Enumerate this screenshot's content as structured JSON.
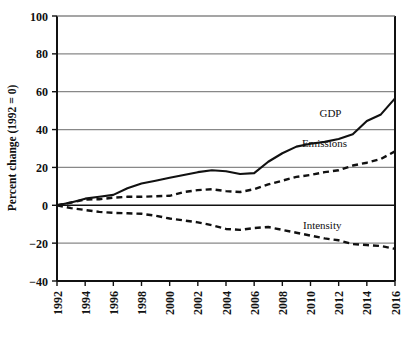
{
  "chart_data": {
    "type": "line",
    "title": "",
    "subtitle": "",
    "xlabel": "",
    "ylabel": "Percent change (1992 = 0)",
    "xlim": [
      1992,
      2016
    ],
    "ylim": [
      -40,
      100
    ],
    "yticks": [
      100,
      80,
      60,
      40,
      20,
      0,
      -20,
      -40
    ],
    "ytick_labels": [
      "100",
      "80",
      "60",
      "40",
      "20",
      "0",
      "−20",
      "−40"
    ],
    "xticks": [
      1992,
      1994,
      1996,
      1998,
      2000,
      2002,
      2004,
      2006,
      2008,
      2010,
      2012,
      2014,
      2016
    ],
    "xtick_labels": [
      "1992",
      "1994",
      "1996",
      "1998",
      "2000",
      "2002",
      "2004",
      "2006",
      "2008",
      "2010",
      "2012",
      "2014",
      "2016"
    ],
    "grid": "horizontal",
    "legend_position": "inline-annotations",
    "zero_line": 0,
    "x": [
      1992,
      1993,
      1994,
      1995,
      1996,
      1997,
      1998,
      1999,
      2000,
      2001,
      2002,
      2003,
      2004,
      2005,
      2006,
      2007,
      2008,
      2009,
      2010,
      2011,
      2012,
      2013,
      2014,
      2015,
      2016
    ],
    "series": [
      {
        "name": "GDP",
        "style": "solid",
        "color": "#111111",
        "label": "GDP",
        "values": [
          0,
          1.5,
          3.5,
          4.5,
          5.5,
          9.0,
          11.5,
          13.0,
          14.5,
          16.0,
          17.5,
          18.5,
          18.0,
          16.5,
          17.0,
          23.0,
          27.5,
          31.0,
          32.5,
          33.5,
          35.0,
          37.5,
          44.5,
          48.0,
          56.5
        ]
      },
      {
        "name": "Emissions",
        "style": "dashed",
        "color": "#111111",
        "label": "Emissions",
        "values": [
          0,
          1.5,
          3.0,
          3.2,
          4.0,
          4.5,
          4.5,
          4.8,
          5.0,
          7.0,
          8.0,
          8.5,
          7.5,
          7.0,
          8.5,
          11.0,
          13.0,
          15.0,
          16.0,
          17.5,
          18.5,
          21.0,
          22.5,
          24.5,
          28.5
        ]
      },
      {
        "name": "Intensity",
        "style": "dashed",
        "color": "#111111",
        "label": "Intensity",
        "values": [
          0,
          -1.5,
          -2.5,
          -3.5,
          -4.0,
          -4.2,
          -4.5,
          -5.5,
          -7.0,
          -8.0,
          -9.0,
          -10.5,
          -12.5,
          -13.0,
          -12.0,
          -11.5,
          -13.0,
          -14.5,
          -16.0,
          -17.5,
          -18.5,
          -20.5,
          -21.0,
          -21.5,
          -23.0
        ]
      }
    ],
    "annotations": [
      {
        "text": "GDP",
        "x": 2012.2,
        "y": 46.5
      },
      {
        "text": "Emissions",
        "x": 2012.6,
        "y": 31.0
      },
      {
        "text": "Intensity",
        "x": 2012.2,
        "y": -12.5
      }
    ],
    "colors": {
      "line": "#111111",
      "grid": "#888888",
      "axis": "#111111",
      "background": "#ffffff"
    }
  }
}
